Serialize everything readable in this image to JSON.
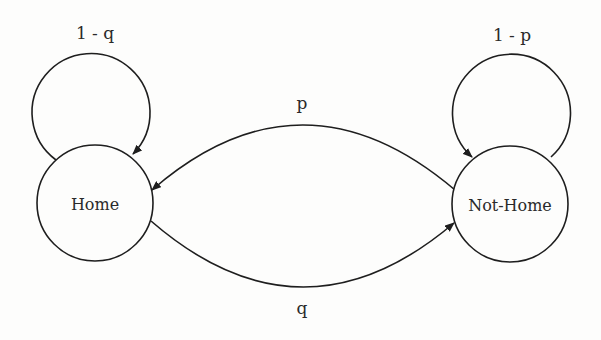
{
  "diagram": {
    "type": "state-transition",
    "states": [
      {
        "id": "home",
        "label": "Home"
      },
      {
        "id": "not_home",
        "label": "Not-Home"
      }
    ],
    "transitions": [
      {
        "from": "home",
        "to": "home",
        "label": "1 - q"
      },
      {
        "from": "not_home",
        "to": "not_home",
        "label": "1 - p"
      },
      {
        "from": "not_home",
        "to": "home",
        "label": "p"
      },
      {
        "from": "home",
        "to": "not_home",
        "label": "q"
      }
    ]
  },
  "colors": {
    "stroke": "#1e1e1e",
    "background": "#fdfdfc"
  }
}
